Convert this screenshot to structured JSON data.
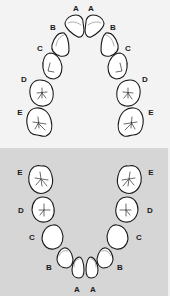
{
  "figure": {
    "colors": {
      "upper_background": "#f3f3f3",
      "lower_background": "#d6d6d6",
      "tooth_fill": "#ffffff",
      "tooth_outline": "#1a1a1a",
      "inner_contour": "#9a9a9a",
      "label": "#1a1a1a"
    }
  },
  "upper_arch": {
    "name": "Maxillary arch",
    "labels": {
      "left": [
        "A",
        "B",
        "C",
        "D",
        "E"
      ],
      "right": [
        "A",
        "B",
        "C",
        "D",
        "E"
      ]
    }
  },
  "lower_arch": {
    "name": "Mandibular arch",
    "labels": {
      "left": [
        "E",
        "D",
        "C",
        "B",
        "A"
      ],
      "right": [
        "E",
        "D",
        "C",
        "B",
        "A"
      ]
    }
  }
}
